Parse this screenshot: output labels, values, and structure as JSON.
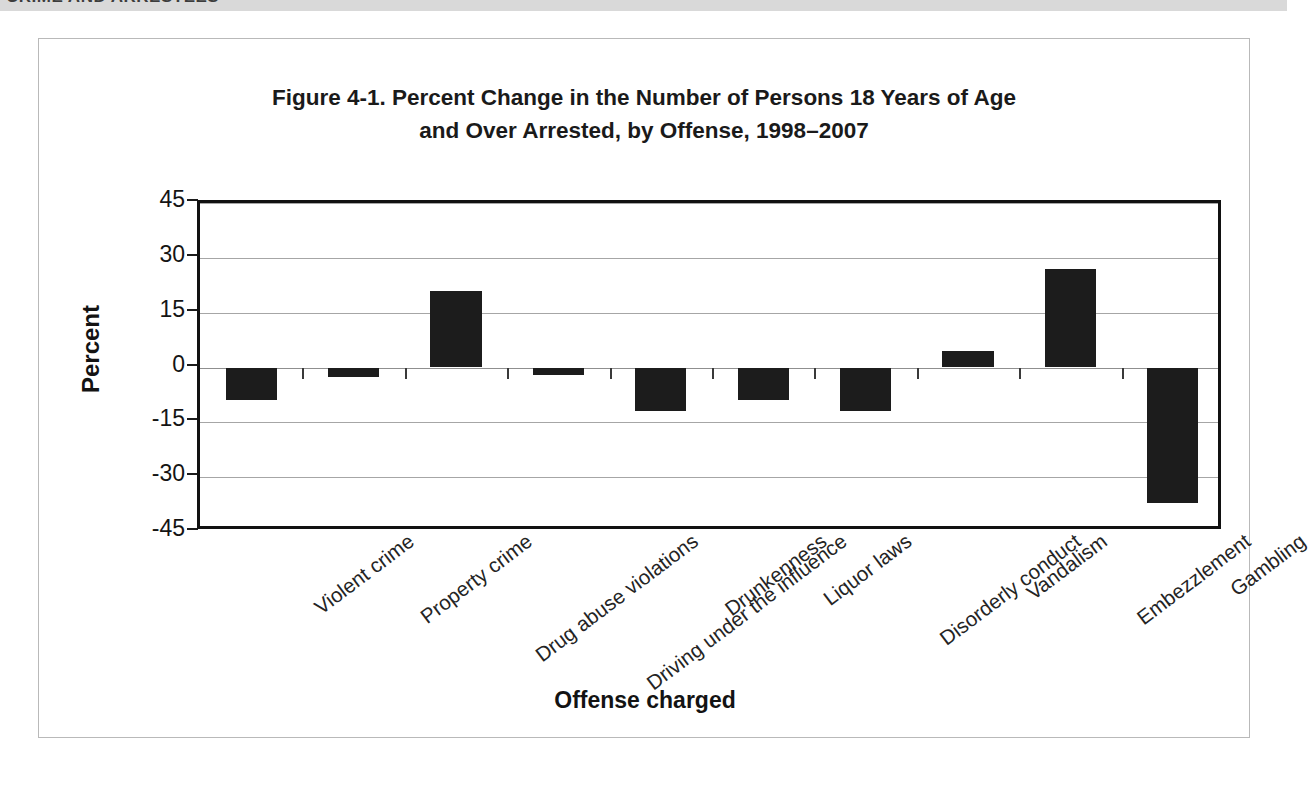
{
  "page_header": {
    "text": "CRIME AND ARRESTEES"
  },
  "figure": {
    "title_line1": "Figure 4-1. Percent Change in the Number of Persons 18 Years of Age",
    "title_line2": "and Over Arrested, by Offense, 1998–2007"
  },
  "chart_data": {
    "type": "bar",
    "title": "Figure 4-1. Percent Change in the Number of Persons 18 Years of Age and Over Arrested, by Offense, 1998–2007",
    "xlabel": "Offense charged",
    "ylabel": "Percent",
    "ylim": [
      -45,
      45
    ],
    "yticks": [
      45,
      30,
      15,
      0,
      -15,
      -30,
      -45
    ],
    "ytick_labels": [
      "45",
      "30",
      "15",
      "0",
      "-15",
      "-30",
      "-45"
    ],
    "grid": true,
    "legend": null,
    "bar_color": "#1c1c1c",
    "categories": [
      "Violent crime",
      "Property crime",
      "Drug abuse violations",
      "Driving under the influence",
      "Drunkenness",
      "Liquor laws",
      "Disorderly conduct",
      "Vandalism",
      "Embezzlement",
      "Gambling"
    ],
    "values": [
      -9,
      -2.5,
      21,
      -2,
      -12,
      -9,
      -12,
      4.5,
      27,
      -37
    ]
  }
}
